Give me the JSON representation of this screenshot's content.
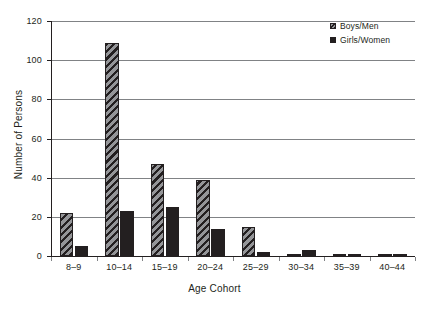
{
  "chart_data": {
    "type": "bar",
    "title": "",
    "xlabel": "Age Cohort",
    "ylabel": "Number of Persons",
    "categories": [
      "8–9",
      "10–14",
      "15–19",
      "20–24",
      "25–29",
      "30–34",
      "35–39",
      "40–44"
    ],
    "series": [
      {
        "name": "Boys/Men",
        "values": [
          22,
          109,
          47,
          39,
          15,
          0.5,
          0.3,
          0.3
        ]
      },
      {
        "name": "Girls/Women",
        "values": [
          5,
          23,
          25,
          14,
          2,
          3,
          1,
          1
        ]
      }
    ],
    "ylim": [
      0,
      120
    ],
    "ytick_labels": [
      "0",
      "20",
      "40",
      "60",
      "80",
      "100",
      "120"
    ],
    "ytick_values": [
      0,
      20,
      40,
      60,
      80,
      100,
      120
    ],
    "grid": "horizontal",
    "legend_position": "top-right",
    "colors": {
      "boys_fill": "#949598",
      "boys_hatch": "#231f20",
      "girls_fill": "#231f20",
      "gridline": "#808285",
      "axis": "#231f20",
      "background": "#ffffff",
      "text": "#231f20"
    }
  },
  "legend": {
    "items": [
      {
        "label": "Boys/Men",
        "swatch": "hatched-square-icon"
      },
      {
        "label": "Girls/Women",
        "swatch": "solid-square-icon"
      }
    ]
  }
}
